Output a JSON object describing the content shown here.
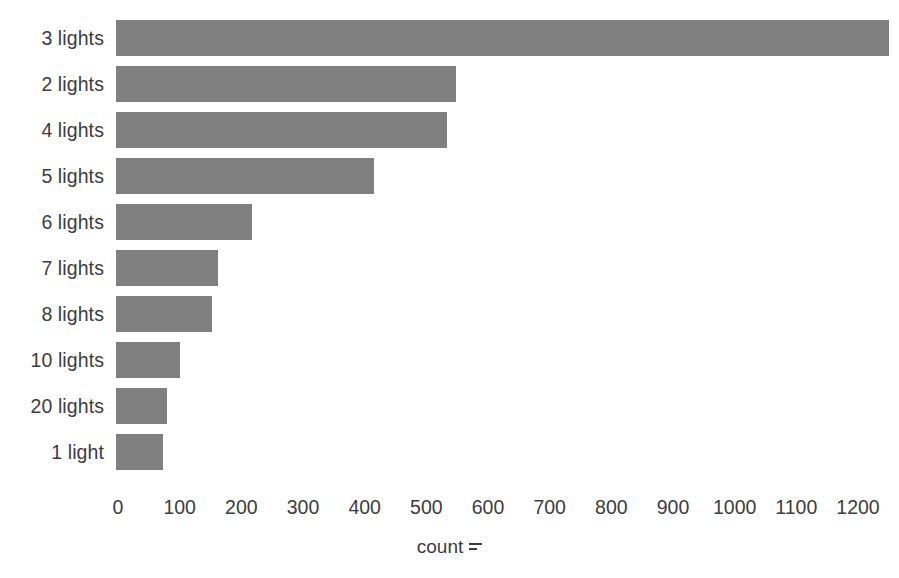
{
  "chart_data": {
    "type": "bar",
    "orientation": "horizontal",
    "title": "",
    "subtitle": "",
    "xlabel": "count",
    "ylabel": "",
    "categories": [
      "3 lights",
      "2 lights",
      "4 lights",
      "5 lights",
      "6 lights",
      "7 lights",
      "8 lights",
      "10 lights",
      "20 lights",
      "1 light"
    ],
    "values": [
      1253,
      551,
      536,
      419,
      221,
      166,
      155,
      103,
      82,
      76
    ],
    "xlim": [
      0,
      1260
    ],
    "xticks": [
      0,
      100,
      200,
      300,
      400,
      500,
      600,
      700,
      800,
      900,
      1000,
      1100,
      1200
    ],
    "xtick_labels": [
      "0",
      "100",
      "200",
      "300",
      "400",
      "500",
      "600",
      "700",
      "800",
      "900",
      "1000",
      "1100",
      "1200"
    ],
    "grid": false,
    "legend": null,
    "bar_color": "#808080",
    "text_color": "#3c3c3c",
    "background_color": "#ffffff",
    "axis_title_glyph": "sort-descending-icon"
  }
}
